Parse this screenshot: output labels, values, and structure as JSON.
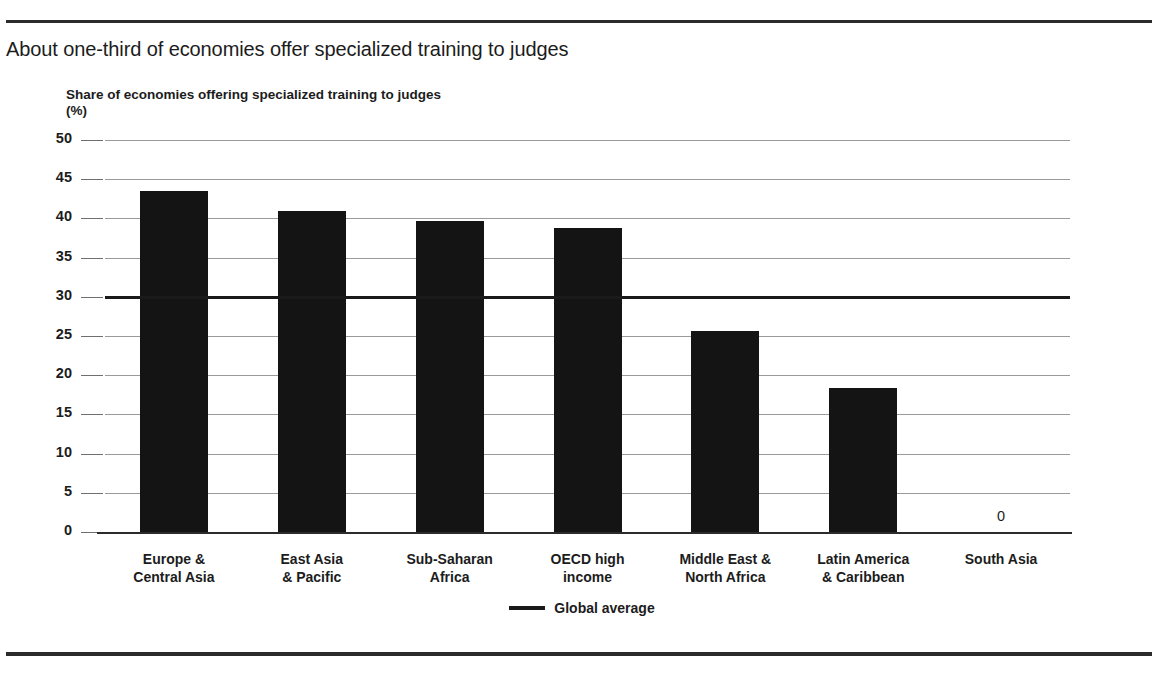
{
  "figure": {
    "title": "About one-third of economies offer specialized training to judges",
    "axis_caption": "Share of economies offering specialized training to judges\n(%)"
  },
  "legend": {
    "position": "bottom-center",
    "entries": [
      {
        "label": "Global average",
        "marker": "line",
        "color": "#1a1a1a"
      }
    ]
  },
  "colors": {
    "bar": "#141414",
    "average_line": "#1a1a1a",
    "gridline": "#9a9a9a",
    "rule": "#2b2b2b",
    "text": "#1c1c1c",
    "background": "#ffffff"
  },
  "chart_data": {
    "type": "bar",
    "title": "About one-third of economies offer specialized training to judges",
    "subtitle": "",
    "xlabel": "",
    "ylabel": "Share of economies offering specialized training to judges (%)",
    "ylim": [
      0,
      50
    ],
    "yticks": [
      0,
      5,
      10,
      15,
      20,
      25,
      30,
      35,
      40,
      45,
      50
    ],
    "ytick_labels": [
      "0",
      "5",
      "10",
      "15",
      "20",
      "25",
      "30",
      "35",
      "40",
      "45",
      "50"
    ],
    "grid": true,
    "legend_position": "bottom-center",
    "categories": [
      "Europe &\nCentral Asia",
      "East Asia\n& Pacific",
      "Sub-Saharan\nAfrica",
      "OECD high\nincome",
      "Middle East &\nNorth Africa",
      "Latin America\n& Caribbean",
      "South Asia"
    ],
    "values": [
      43.5,
      41.0,
      39.7,
      38.8,
      25.6,
      18.4,
      0
    ],
    "data_labels": [
      "",
      "",
      "",
      "",
      "",
      "",
      "0"
    ],
    "annotations": [
      {
        "type": "hline",
        "label": "Global average",
        "value": 30.0
      }
    ]
  }
}
